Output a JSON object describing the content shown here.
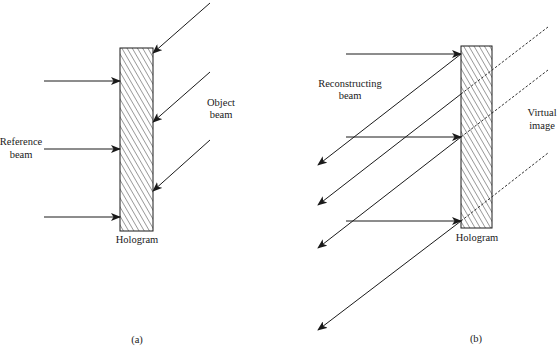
{
  "figure": {
    "panels": [
      {
        "id": "a",
        "caption": "(a)",
        "hologram_label": "Hologram",
        "reference_label": [
          "Reference",
          "beam"
        ],
        "object_label": [
          "Object",
          "beam"
        ],
        "hologram_rect": {
          "x": 120,
          "y": 48,
          "w": 33,
          "h": 183
        },
        "reference_arrows": [
          {
            "x1": 44,
            "y1": 81,
            "x2": 120,
            "y2": 81
          },
          {
            "x1": 44,
            "y1": 149,
            "x2": 120,
            "y2": 149
          },
          {
            "x1": 44,
            "y1": 217,
            "x2": 120,
            "y2": 217
          }
        ],
        "object_arrows": [
          {
            "x1": 210,
            "y1": 3,
            "x2": 153,
            "y2": 53
          },
          {
            "x1": 210,
            "y1": 72,
            "x2": 153,
            "y2": 122
          },
          {
            "x1": 210,
            "y1": 140,
            "x2": 153,
            "y2": 191
          }
        ]
      },
      {
        "id": "b",
        "caption": "(b)",
        "hologram_label": "Hologram",
        "reconstructing_label": [
          "Reconstructing",
          "beam"
        ],
        "virtual_label": [
          "Virtual",
          "image"
        ],
        "hologram_rect": {
          "x": 461,
          "y": 46,
          "w": 31,
          "h": 182
        },
        "reconstructing_arrows": [
          {
            "x1": 346,
            "y1": 54,
            "x2": 461,
            "y2": 54
          },
          {
            "x1": 346,
            "y1": 137,
            "x2": 461,
            "y2": 137
          },
          {
            "x1": 346,
            "y1": 221,
            "x2": 461,
            "y2": 221
          }
        ],
        "diffracted_arrows": [
          {
            "x1": 461,
            "y1": 54,
            "x2": 318,
            "y2": 165
          },
          {
            "x1": 461,
            "y1": 94,
            "x2": 318,
            "y2": 205
          },
          {
            "x1": 461,
            "y1": 137,
            "x2": 318,
            "y2": 248
          },
          {
            "x1": 461,
            "y1": 221,
            "x2": 318,
            "y2": 330
          }
        ],
        "virtual_rays": [
          {
            "x1": 461,
            "y1": 94,
            "x2": 548,
            "y2": 27
          },
          {
            "x1": 461,
            "y1": 137,
            "x2": 548,
            "y2": 70
          },
          {
            "x1": 461,
            "y1": 221,
            "x2": 548,
            "y2": 153
          }
        ]
      }
    ]
  }
}
